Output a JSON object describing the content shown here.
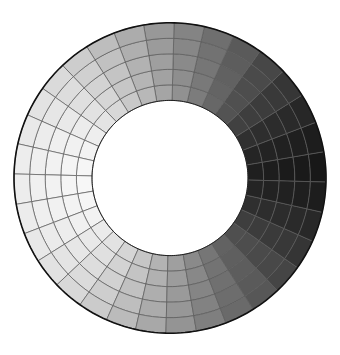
{
  "figure": {
    "type": "shaded-polar-mesh-annulus",
    "title": "",
    "background_color": "#ffffff",
    "canvas": {
      "width": 340,
      "height": 355
    }
  },
  "chart_data": {
    "type": "heatmap",
    "subtype": "polar-annulus-mesh",
    "title": "",
    "subtitle": "",
    "xlabel": "",
    "ylabel": "",
    "legend": null,
    "grid": true,
    "colormap": "grayscale",
    "colormap_min_hex": "#0a0a0a",
    "colormap_max_hex": "#fafafa",
    "geometry": {
      "center_x": 170,
      "center_y": 178,
      "outer_radius": 156,
      "inner_radius": 78,
      "radial_rings": 5,
      "angular_sectors": 32,
      "total_cells": 160,
      "angle_start_deg": 0,
      "angle_end_deg": 360,
      "squash_y": 0.995,
      "rotation_deg": -1.5
    },
    "mesh": {
      "line_color": "#5a5a5a",
      "line_width": 0.7,
      "outline_color": "#111111",
      "outline_width": 1.6
    },
    "shading": {
      "model": "cosine-azimuth-lambert",
      "description": "Cell gray level varies as a function of azimuth angle: brightest at due west (180 deg), darkest at due east (0 deg), mid-gray at north and south. A mild radial term brightens the inner rings on the lit side.",
      "azimuth_bright_deg": 180,
      "azimuth_dark_deg": 0,
      "value_at_bright": 0.97,
      "value_at_dark": 0.035,
      "value_at_north": 0.47,
      "value_at_south": 0.47,
      "radial_gain_inner": 0.085,
      "radial_gain_outer": -0.045,
      "gamma": 1.18
    },
    "ring_radii": [
      78,
      93.6,
      109.2,
      124.8,
      140.4,
      156
    ],
    "ring_labels": [
      "r1",
      "r2",
      "r3",
      "r4",
      "r5"
    ],
    "sector_angles_deg": [
      0,
      11.25,
      22.5,
      33.75,
      45,
      56.25,
      67.5,
      78.75,
      90,
      101.25,
      112.5,
      123.75,
      135,
      146.25,
      157.5,
      168.75,
      180,
      191.25,
      202.5,
      213.75,
      225,
      236.25,
      247.5,
      258.75,
      270,
      281.25,
      292.5,
      303.75,
      315,
      326.25,
      337.5,
      348.75
    ],
    "values_by_ring": [
      [
        0.055,
        0.075,
        0.115,
        0.175,
        0.245,
        0.325,
        0.415,
        0.505,
        0.595,
        0.685,
        0.765,
        0.835,
        0.895,
        0.94,
        0.968,
        0.982,
        0.985,
        0.978,
        0.96,
        0.928,
        0.882,
        0.822,
        0.748,
        0.662,
        0.57,
        0.478,
        0.388,
        0.305,
        0.23,
        0.165,
        0.11,
        0.072
      ],
      [
        0.05,
        0.07,
        0.108,
        0.166,
        0.234,
        0.313,
        0.402,
        0.492,
        0.582,
        0.672,
        0.752,
        0.824,
        0.884,
        0.93,
        0.958,
        0.972,
        0.975,
        0.968,
        0.95,
        0.918,
        0.872,
        0.812,
        0.738,
        0.65,
        0.558,
        0.466,
        0.377,
        0.295,
        0.221,
        0.158,
        0.104,
        0.067
      ],
      [
        0.045,
        0.064,
        0.1,
        0.156,
        0.222,
        0.3,
        0.388,
        0.478,
        0.568,
        0.658,
        0.738,
        0.81,
        0.87,
        0.917,
        0.945,
        0.96,
        0.963,
        0.956,
        0.938,
        0.906,
        0.86,
        0.8,
        0.725,
        0.638,
        0.546,
        0.454,
        0.365,
        0.284,
        0.212,
        0.15,
        0.098,
        0.062
      ],
      [
        0.04,
        0.057,
        0.092,
        0.146,
        0.21,
        0.287,
        0.374,
        0.464,
        0.554,
        0.644,
        0.724,
        0.796,
        0.857,
        0.904,
        0.932,
        0.948,
        0.951,
        0.944,
        0.926,
        0.894,
        0.848,
        0.787,
        0.712,
        0.625,
        0.533,
        0.441,
        0.353,
        0.273,
        0.203,
        0.142,
        0.092,
        0.057
      ],
      [
        0.034,
        0.05,
        0.083,
        0.135,
        0.197,
        0.273,
        0.359,
        0.449,
        0.539,
        0.629,
        0.709,
        0.781,
        0.843,
        0.89,
        0.919,
        0.935,
        0.938,
        0.931,
        0.913,
        0.881,
        0.834,
        0.773,
        0.698,
        0.611,
        0.519,
        0.427,
        0.34,
        0.261,
        0.192,
        0.133,
        0.085,
        0.051
      ]
    ]
  }
}
